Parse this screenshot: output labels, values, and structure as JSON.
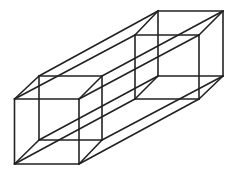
{
  "figure": {
    "width": 235,
    "height": 171,
    "stroke_color": "#222222",
    "stroke_width": 1.6,
    "background": "#ffffff",
    "vertices": {
      "LF_TL": [
        14.5,
        99
      ],
      "LF_TR": [
        79,
        99
      ],
      "LF_BR": [
        79,
        164
      ],
      "LF_BL": [
        14.5,
        164
      ],
      "LB_TL": [
        39,
        76
      ],
      "LB_TR": [
        102,
        76
      ],
      "LB_BR": [
        102,
        140
      ],
      "LB_BL": [
        39,
        140
      ],
      "RF_TL": [
        135,
        35
      ],
      "RF_TR": [
        199,
        35
      ],
      "RF_BR": [
        199,
        99
      ],
      "RF_BL": [
        135,
        99
      ],
      "RB_TL": [
        158,
        11
      ],
      "RB_TR": [
        223,
        11
      ],
      "RB_BR": [
        223,
        76
      ],
      "RB_BL": [
        158,
        76
      ]
    },
    "edges": [
      [
        "LF_TL",
        "LF_TR"
      ],
      [
        "LF_TR",
        "LF_BR"
      ],
      [
        "LF_BR",
        "LF_BL"
      ],
      [
        "LF_BL",
        "LF_TL"
      ],
      [
        "LB_TL",
        "LB_TR"
      ],
      [
        "LB_TR",
        "LB_BR"
      ],
      [
        "LB_BR",
        "LB_BL"
      ],
      [
        "LB_BL",
        "LB_TL"
      ],
      [
        "RF_TL",
        "RF_TR"
      ],
      [
        "RF_TR",
        "RF_BR"
      ],
      [
        "RF_BR",
        "RF_BL"
      ],
      [
        "RF_BL",
        "RF_TL"
      ],
      [
        "RB_TL",
        "RB_TR"
      ],
      [
        "RB_TR",
        "RB_BR"
      ],
      [
        "RB_BR",
        "RB_BL"
      ],
      [
        "RB_BL",
        "RB_TL"
      ],
      [
        "LF_TL",
        "LB_TL"
      ],
      [
        "LF_TR",
        "LB_TR"
      ],
      [
        "LF_BR",
        "LB_BR"
      ],
      [
        "LF_BL",
        "LB_BL"
      ],
      [
        "RF_TL",
        "RB_TL"
      ],
      [
        "RF_TR",
        "RB_TR"
      ],
      [
        "RF_BR",
        "RB_BR"
      ],
      [
        "RF_BL",
        "RB_BL"
      ],
      [
        "LF_TL",
        "RF_TL"
      ],
      [
        "LF_TR",
        "RF_TR"
      ],
      [
        "LF_BR",
        "RF_BR"
      ],
      [
        "LF_BL",
        "RF_BL"
      ],
      [
        "LB_TL",
        "RB_TL"
      ],
      [
        "LB_TR",
        "RB_TR"
      ],
      [
        "LB_BR",
        "RB_BR"
      ],
      [
        "LB_BL",
        "RB_BL"
      ]
    ]
  }
}
